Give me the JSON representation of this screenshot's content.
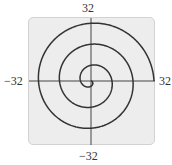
{
  "chart_data": {
    "type": "line",
    "title": "",
    "equation": "r = 16θ/(3π)",
    "theta_range": [
      0,
      18.85
    ],
    "xlim": [
      -32,
      32
    ],
    "ylim": [
      -32,
      32
    ],
    "xlabel": "",
    "ylabel": "",
    "tick_labels": {
      "top": "32",
      "bottom": "−32",
      "left": "−32",
      "right": "32"
    },
    "grid": false,
    "axes_crossing": [
      0,
      0
    ],
    "turns": 3,
    "end_point": [
      32,
      0
    ],
    "line_color": "#333333",
    "background_color": "#ededed"
  },
  "labels": {
    "top": "32",
    "bottom": "−32",
    "left": "−32",
    "right": "32"
  }
}
